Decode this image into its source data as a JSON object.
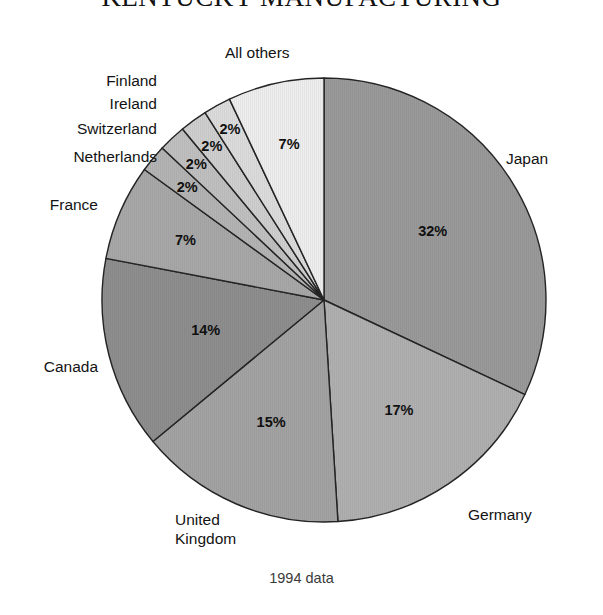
{
  "chart": {
    "title": "KENTUCKY MANUFACTURING",
    "caption": "1994 data"
  },
  "labels": {
    "japan": "Japan",
    "germany": "Germany",
    "united_kingdom_line1": "United",
    "united_kingdom_line2": "Kingdom",
    "canada": "Canada",
    "france": "France",
    "netherlands": "Netherlands",
    "switzerland": "Switzerland",
    "ireland": "Ireland",
    "finland": "Finland",
    "all_others": "All others"
  },
  "values": {
    "japan": "32%",
    "germany": "17%",
    "united_kingdom": "15%",
    "canada": "14%",
    "france": "7%",
    "netherlands": "2%",
    "switzerland": "2%",
    "ireland": "2%",
    "finland": "2%",
    "all_others": "7%"
  },
  "chart_data": {
    "type": "pie",
    "title": "KENTUCKY MANUFACTURING",
    "subtitle": "1994 data",
    "xlabel": "",
    "ylabel": "",
    "legend_position": "outside-labels",
    "grid": false,
    "start_angle_deg": 0,
    "direction": "clockwise",
    "units": "percent",
    "categories": [
      "Japan",
      "Germany",
      "United Kingdom",
      "Canada",
      "France",
      "Netherlands",
      "Switzerland",
      "Ireland",
      "Finland",
      "All others"
    ],
    "values": [
      32,
      17,
      15,
      14,
      7,
      2,
      2,
      2,
      2,
      7
    ],
    "value_labels": [
      "32%",
      "17%",
      "15%",
      "14%",
      "7%",
      "2%",
      "2%",
      "2%",
      "2%",
      "7%"
    ],
    "slice_colors": [
      "#9a9a9a",
      "#b0b0b0",
      "#a3a3a3",
      "#8e8e8e",
      "#a8a8a8",
      "#b4b4b4",
      "#c0c0c0",
      "#cfcfcf",
      "#dcdcdc",
      "#eeeeee"
    ],
    "slice_outline_color": "#242424",
    "total": 100
  }
}
